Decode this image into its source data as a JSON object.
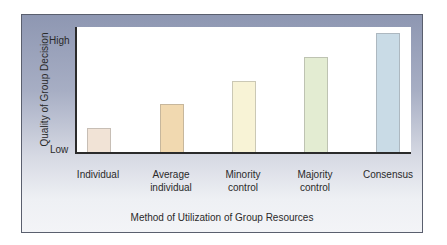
{
  "chart_data": {
    "type": "bar",
    "title": "",
    "xlabel": "Method of Utilization of Group Resources",
    "ylabel": "Quality of Group Decision",
    "y_tick_labels": [
      "Low",
      "High"
    ],
    "categories": [
      "Individual",
      "Average individual",
      "Minority control",
      "Majority control",
      "Consensus"
    ],
    "category_lines": [
      [
        "Individual"
      ],
      [
        "Average",
        "individual"
      ],
      [
        "Minority",
        "control"
      ],
      [
        "Majority",
        "control"
      ],
      [
        "Consensus"
      ]
    ],
    "values": [
      20,
      40,
      60,
      80,
      100
    ],
    "ylim": [
      0,
      105
    ],
    "value_scale_note": "Qualitative scale from Low to High",
    "bar_colors": [
      "#f1e3d6",
      "#f1d9b0",
      "#f8f3d6",
      "#e3ecd2",
      "#c9dbe6"
    ],
    "grid": false,
    "legend": null
  },
  "colors": {
    "frame_top": "#8e97b2",
    "frame_bottom": "#f3f4f7",
    "plot_background": "#ffffff",
    "axis": "#2b2b2b"
  }
}
